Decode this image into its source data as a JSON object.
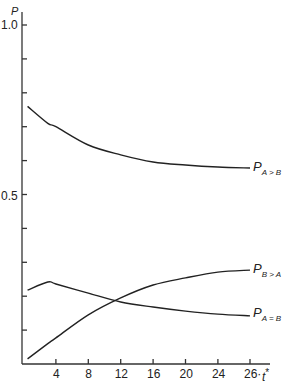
{
  "chart_data": {
    "type": "line",
    "title": "",
    "xlabel": "t*",
    "ylabel": "P",
    "xlim": [
      0,
      28
    ],
    "ylim": [
      0,
      1.0
    ],
    "x_ticks": [
      4,
      8,
      12,
      16,
      20,
      24,
      26
    ],
    "x_tick_labels": [
      "4",
      "8",
      "12",
      "16",
      "20",
      "24",
      "26·"
    ],
    "y_ticks": [
      0.1,
      0.2,
      0.3,
      0.4,
      0.5,
      0.6,
      0.7,
      0.8,
      0.9,
      1.0
    ],
    "y_tick_labels": [
      "1.0",
      "0.5"
    ],
    "grid": false,
    "legend": "inline labels at right end of curves",
    "x": [
      0.5,
      3,
      4,
      8,
      12,
      16,
      20,
      24,
      26
    ],
    "series": [
      {
        "name": "P_{A>B}",
        "label_main": "P",
        "label_sub": "A > B",
        "values": [
          0.76,
          0.71,
          0.7,
          0.646,
          0.617,
          0.596,
          0.587,
          0.581,
          0.578
        ]
      },
      {
        "name": "P_{B>A}",
        "label_main": "P",
        "label_sub": "B > A",
        "values": [
          0.015,
          0.06,
          0.077,
          0.145,
          0.195,
          0.233,
          0.254,
          0.271,
          0.277
        ]
      },
      {
        "name": "P_{A=B}",
        "label_main": "P",
        "label_sub": "A = B",
        "values": [
          0.218,
          0.242,
          0.236,
          0.209,
          0.183,
          0.168,
          0.156,
          0.147,
          0.142
        ]
      }
    ]
  },
  "labels": {
    "y_axis": "P",
    "x_axis_main": "t",
    "x_axis_sup": "*",
    "y_1_0": "1.0",
    "y_0_5": "0.5"
  }
}
